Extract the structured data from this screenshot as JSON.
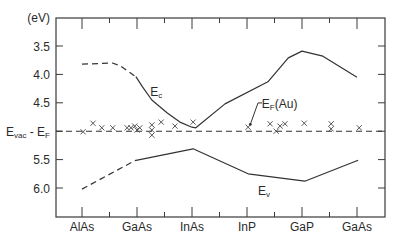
{
  "chart_data": {
    "type": "line",
    "title": "",
    "xlabel": "",
    "ylabel": "(eV)",
    "ylim": [
      3.0,
      6.5
    ],
    "y_inverted": true,
    "grid": false,
    "legend": "none (curves labelled inline)",
    "categories": [
      "AlAs",
      "GaAs",
      "InAs",
      "InP",
      "GaP",
      "GaAs"
    ],
    "y_ticks": [
      {
        "value": 3.5,
        "label": "3.5"
      },
      {
        "value": 4.0,
        "label": "4.0"
      },
      {
        "value": 4.5,
        "label": "4.5"
      },
      {
        "value": 5.0,
        "label": "E",
        "sub": "vac",
        "suffix": " - E",
        "suffix_sub": "F"
      },
      {
        "value": 5.5,
        "label": "5.5"
      },
      {
        "value": 6.0,
        "label": "6.0"
      }
    ],
    "reference_line": {
      "name": "Evac - EF",
      "value": 5.0,
      "style": "dashed"
    },
    "series": [
      {
        "name": "Ec",
        "segments": [
          {
            "style": "dashed",
            "points": [
              [
                0.0,
                3.82
              ],
              [
                0.55,
                3.8
              ],
              [
                0.7,
                3.85
              ],
              [
                0.98,
                4.04
              ]
            ]
          },
          {
            "style": "solid",
            "points": [
              [
                0.98,
                4.04
              ],
              [
                1.1,
                4.22
              ],
              [
                1.27,
                4.45
              ],
              [
                1.55,
                4.68
              ],
              [
                1.78,
                4.84
              ],
              [
                2.0,
                4.93
              ],
              [
                2.07,
                4.94
              ],
              [
                2.6,
                4.52
              ],
              [
                3.38,
                4.13
              ],
              [
                3.75,
                3.71
              ],
              [
                4.0,
                3.59
              ],
              [
                4.38,
                3.68
              ],
              [
                5.0,
                4.05
              ]
            ]
          }
        ]
      },
      {
        "name": "Ev",
        "segments": [
          {
            "style": "dashed",
            "points": [
              [
                0.0,
                6.02
              ],
              [
                0.96,
                5.52
              ]
            ]
          },
          {
            "style": "solid",
            "points": [
              [
                0.96,
                5.52
              ],
              [
                2.02,
                5.31
              ],
              [
                3.02,
                5.75
              ],
              [
                4.05,
                5.88
              ],
              [
                5.02,
                5.51
              ]
            ]
          }
        ]
      }
    ],
    "markers": {
      "name": "EF(Au) measured",
      "symbol": "x",
      "points": [
        [
          0.02,
          5.01
        ],
        [
          0.2,
          4.86
        ],
        [
          0.36,
          4.94
        ],
        [
          0.56,
          4.94
        ],
        [
          0.82,
          4.94
        ],
        [
          0.89,
          4.94
        ],
        [
          0.96,
          4.91
        ],
        [
          1.0,
          4.98
        ],
        [
          1.05,
          4.94
        ],
        [
          1.27,
          4.89
        ],
        [
          1.27,
          4.98
        ],
        [
          1.27,
          5.07
        ],
        [
          1.44,
          4.84
        ],
        [
          1.69,
          4.91
        ],
        [
          2.02,
          4.84
        ],
        [
          3.02,
          4.93
        ],
        [
          3.42,
          4.87
        ],
        [
          3.53,
          5.0
        ],
        [
          3.6,
          4.91
        ],
        [
          3.69,
          4.87
        ],
        [
          4.04,
          4.86
        ],
        [
          4.53,
          4.87
        ],
        [
          4.53,
          4.96
        ],
        [
          5.04,
          4.94
        ]
      ]
    },
    "annotations": [
      {
        "id": "ec-label",
        "text": "E",
        "sub": "c",
        "x": 1.24,
        "y": 4.38
      },
      {
        "id": "ev-label",
        "text": "E",
        "sub": "v",
        "x": 3.2,
        "y": 6.12
      },
      {
        "id": "ef-au-label",
        "text": "E",
        "sub": "F",
        "suffix": "(Au)",
        "x": 3.27,
        "y": 4.6,
        "arrow": {
          "from": [
            3.2,
            4.52
          ],
          "to": [
            3.06,
            4.88
          ]
        }
      }
    ]
  }
}
